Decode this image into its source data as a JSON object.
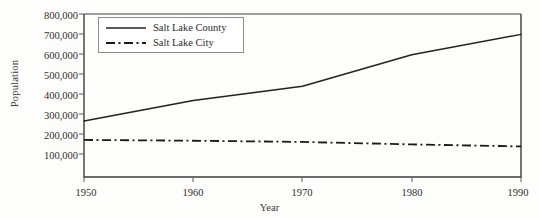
{
  "chart_data": {
    "type": "line",
    "title": "",
    "xlabel": "Year",
    "ylabel": "Population",
    "x": [
      1950,
      1960,
      1970,
      1980,
      1990
    ],
    "xlim": [
      1950,
      1990
    ],
    "ylim": [
      0,
      800000
    ],
    "xticks": [
      "1950",
      "1960",
      "1970",
      "1980",
      "1990"
    ],
    "yticks": [
      "100,000",
      "200,000",
      "300,000",
      "400,000",
      "500,000",
      "600,000",
      "700,000",
      "800,000"
    ],
    "ytick_values": [
      100000,
      200000,
      300000,
      400000,
      500000,
      600000,
      700000,
      800000
    ],
    "grid": false,
    "legend_position": "upper-left",
    "series": [
      {
        "name": "Salt Lake County",
        "style": "solid",
        "color": "#222222",
        "values": [
          275000,
          375000,
          445000,
          600000,
          700000
        ]
      },
      {
        "name": "Salt Lake City",
        "style": "dash-dot",
        "color": "#1a1a1a",
        "values": [
          182000,
          178000,
          172000,
          160000,
          150000
        ]
      }
    ]
  },
  "axes": {
    "y_title": "Population",
    "x_title": "Year",
    "yticks": [
      {
        "label": "800,000"
      },
      {
        "label": "700,000"
      },
      {
        "label": "600,000"
      },
      {
        "label": "500,000"
      },
      {
        "label": "400,000"
      },
      {
        "label": "300,000"
      },
      {
        "label": "200,000"
      },
      {
        "label": "100,000"
      }
    ],
    "xticks": [
      {
        "label": "1950"
      },
      {
        "label": "1960"
      },
      {
        "label": "1970"
      },
      {
        "label": "1980"
      },
      {
        "label": "1990"
      }
    ]
  },
  "legend": {
    "entries": [
      {
        "label": "Salt Lake County",
        "style": "solid"
      },
      {
        "label": "Salt Lake City",
        "style": "dash-dot"
      }
    ]
  },
  "colors": {
    "background": "#fdfdfb",
    "axis": "#3c3c3c",
    "series_county": "#222222",
    "series_city": "#1a1a1a",
    "legend_border": "#8d8d8d"
  }
}
